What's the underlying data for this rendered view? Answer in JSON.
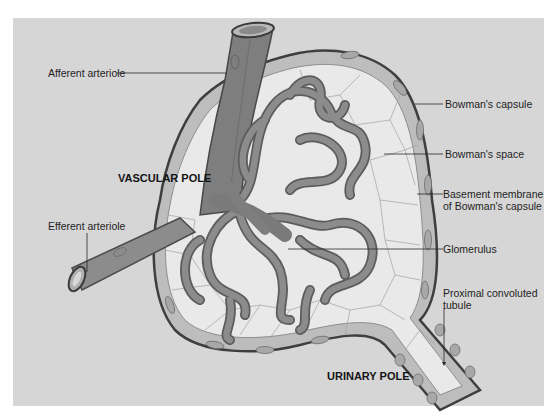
{
  "figure": {
    "colors": {
      "background": "#d6d6d6",
      "vessel_fill": "#7e7e7e",
      "vessel_outline": "#474747",
      "capsule_cell": "#b4b4b4",
      "bowmans_space": "#e9e9e9",
      "cell_line": "#9a9a9a",
      "leader_line": "#2a2a2a"
    }
  },
  "labels": {
    "afferent_arteriole": "Afferent arteriole",
    "vascular_pole": "VASCULAR POLE",
    "efferent_arteriole": "Efferent arteriole",
    "bowmans_capsule": "Bowman's capsule",
    "bowmans_space": "Bowman's space",
    "basement_membrane": "Basement membrane\nof Bowman's capsule",
    "glomerulus": "Glomerulus",
    "proximal_tubule": "Proximal convoluted\ntubule",
    "urinary_pole": "URINARY POLE"
  }
}
